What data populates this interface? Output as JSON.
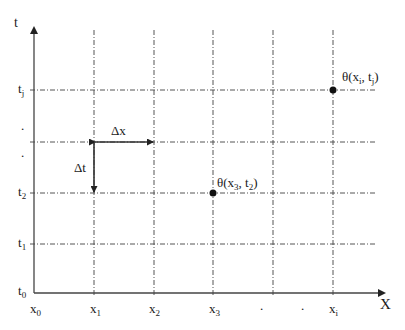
{
  "diagram": {
    "title": "",
    "axes": {
      "x_axis_label": "X",
      "y_axis_label": "t"
    },
    "x_ticks": [
      {
        "base": "x",
        "sub": "0"
      },
      {
        "base": "x",
        "sub": "1"
      },
      {
        "base": "x",
        "sub": "2"
      },
      {
        "base": "x",
        "sub": "3"
      },
      {
        "base": "x",
        "sub": "i"
      }
    ],
    "x_ellipsis": [
      ".",
      "."
    ],
    "y_ticks": [
      {
        "base": "t",
        "sub": "0"
      },
      {
        "base": "t",
        "sub": "1"
      },
      {
        "base": "t",
        "sub": "2"
      },
      {
        "base": "t",
        "sub": "j"
      }
    ],
    "y_ellipsis": [
      ".",
      "."
    ],
    "steps": {
      "dx_label": "Δx",
      "dt_label": "Δt"
    },
    "points": [
      {
        "label_prefix": "θ(x",
        "sub1": "3",
        "mid": ", t",
        "sub2": "2",
        "suffix": ")"
      },
      {
        "label_prefix": "θ(x",
        "sub1": "i",
        "mid": ", t",
        "sub2": "j",
        "suffix": ")"
      }
    ],
    "colors": {
      "axis": "#4a4a4a",
      "grid": "#555555",
      "point": "#111111"
    }
  }
}
